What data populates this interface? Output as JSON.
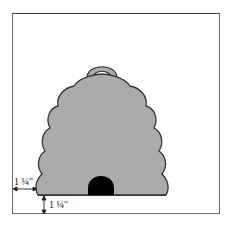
{
  "diagram": {
    "colors": {
      "hive_fill": "#ababab",
      "hive_stroke": "#333333",
      "door_fill": "#000000",
      "frame_stroke": "#6e6e6e"
    },
    "dimensions": {
      "side_margin_label": "1 ¼\"",
      "bottom_margin_label": "1 ¼\""
    }
  }
}
